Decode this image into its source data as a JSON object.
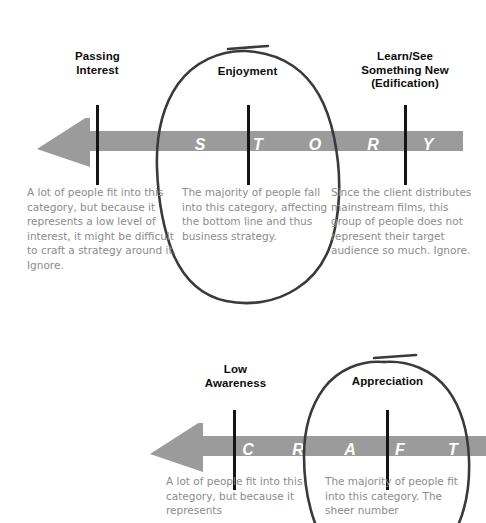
{
  "page": {
    "background_color": "#ffffff",
    "arrow_color": "#9b9b9b",
    "tick_color": "#141414",
    "label_color": "#0d0d0d",
    "body_text_color": "#8c8c8c",
    "letter_color": "#ffffff",
    "annotation_color": "#3a3a3a"
  },
  "sections": [
    {
      "id": "story",
      "word": "STORY",
      "letters": [
        "S",
        "T",
        "O",
        "R",
        "Y"
      ],
      "arrow_direction": "left",
      "labels": [
        {
          "id": "passing-interest",
          "text": "Passing\nInterest",
          "line1": "Passing",
          "line2": "Interest"
        },
        {
          "id": "enjoyment",
          "text": "Enjoyment",
          "line1": "Enjoyment",
          "line2": ""
        },
        {
          "id": "learn-see-something-new",
          "text": "Learn/See\nSomething New\n(Edification)",
          "line1": "Learn/See",
          "line2": "Something New",
          "line3": "(Edification)"
        }
      ],
      "descriptions": [
        {
          "id": "passing-interest-desc",
          "text": "A lot of people fit into this category, but because it represents a low level of interest, it might be difficult to craft a strategy around it. Ignore."
        },
        {
          "id": "enjoyment-desc",
          "text": "The majority of people fall into this category, affecting the bottom line and thus business strategy."
        },
        {
          "id": "learn-see-something-new-desc",
          "text": "Since the client distributes mainstream films, this group of people does not represent their target audience so much. Ignore."
        }
      ],
      "highlighted": "enjoyment"
    },
    {
      "id": "craft",
      "word": "CRAFT",
      "letters": [
        "C",
        "R",
        "A",
        "F",
        "T"
      ],
      "arrow_direction": "left",
      "labels": [
        {
          "id": "low-awareness",
          "text": "Low\nAwareness",
          "line1": "Low",
          "line2": "Awareness"
        },
        {
          "id": "appreciation",
          "text": "Appreciation",
          "line1": "Appreciation",
          "line2": ""
        }
      ],
      "descriptions": [
        {
          "id": "low-awareness-desc",
          "text": "A lot of people fit into this category, but because it represents"
        },
        {
          "id": "appreciation-desc",
          "text": "The majority of people fit into this category. The sheer number"
        }
      ],
      "highlighted": "appreciation"
    }
  ]
}
